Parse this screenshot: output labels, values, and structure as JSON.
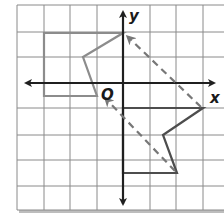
{
  "figure": {
    "type": "coordinate-grid-transformation",
    "axes": {
      "x_label": "x",
      "y_label": "y",
      "origin_label": "O"
    },
    "grid": {
      "unit_px": 26.5,
      "origin_px": [
        123,
        83
      ],
      "x_range": [
        -4,
        3
      ],
      "y_range": [
        -5,
        3
      ]
    },
    "colors": {
      "grid": "#8a8a8a",
      "axes": "#1f1f1f",
      "preimage": "#8c8c8c",
      "image": "#4d4d4d",
      "arrow": "#777777",
      "shadow": "#bdbdbd"
    },
    "preimage": {
      "name": "upper-figure",
      "vertices": [
        [
          0,
          2
        ],
        [
          -3,
          2
        ],
        [
          -3,
          -0.5
        ],
        [
          -1,
          -0.5
        ],
        [
          -1.5,
          1
        ]
      ]
    },
    "image": {
      "name": "lower-figure",
      "vertices": [
        [
          0,
          -1
        ],
        [
          3,
          -1
        ],
        [
          1.5,
          -2
        ],
        [
          2,
          -3.5
        ],
        [
          0,
          -3.5
        ]
      ]
    },
    "arrows": [
      {
        "name": "translation-arrow-1",
        "from": [
          3,
          -1
        ],
        "to": [
          0,
          2
        ],
        "style": "dashed"
      },
      {
        "name": "translation-arrow-2",
        "from": [
          2,
          -3.5
        ],
        "to": [
          -0.8,
          -0.5
        ],
        "style": "dashed"
      }
    ]
  }
}
